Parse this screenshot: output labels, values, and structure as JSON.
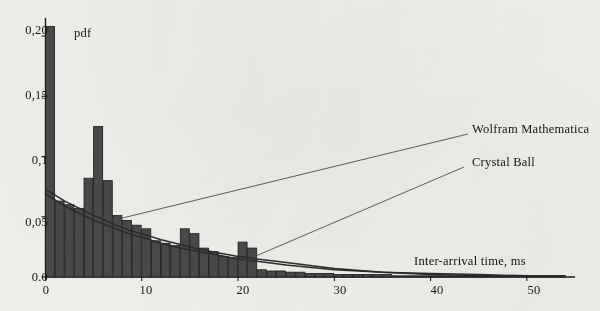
{
  "figure": {
    "background_color": "#f3f1ed",
    "ink_color": "#1c1c1c",
    "bar_fill_color": "#4a4a4a",
    "bar_edge_color": "#1a1a1a",
    "curve_color": "#2b2b2b",
    "leader_line_color": "#4d4d4d"
  },
  "axes": {
    "y_axis_name": "pdf",
    "x_axis_title": "Inter-arrival time, ms",
    "y_tick_labels": [
      "0,20",
      "0,15",
      "0,1",
      "0,05",
      "0.0"
    ],
    "y_tick_values": [
      0.2,
      0.15,
      0.1,
      0.05,
      0.0
    ],
    "x_tick_labels": [
      "0",
      "10",
      "20",
      "30",
      "40",
      "50"
    ],
    "x_tick_values": [
      0,
      10,
      20,
      30,
      40,
      50
    ]
  },
  "annotations": [
    {
      "name": "wolfram-mathematica",
      "label": "Wolfram Mathematica"
    },
    {
      "name": "crystal-ball",
      "label": "Crystal Ball"
    }
  ],
  "chart_data": {
    "type": "bar",
    "title": "",
    "subtitle": "",
    "xlabel": "Inter-arrival time, ms",
    "ylabel": "pdf",
    "xlim": [
      0,
      55
    ],
    "ylim": [
      0.0,
      0.215
    ],
    "grid": false,
    "legend": "annotated leader lines at right",
    "x_tick_labels": [
      "0",
      "10",
      "20",
      "30",
      "40",
      "50"
    ],
    "y_tick_labels": [
      "0,20",
      "0,15",
      "0,1",
      "0,05",
      "0.0"
    ],
    "bin_width": 1,
    "categories": [
      "0-1",
      "1-2",
      "2-3",
      "3-4",
      "4-5",
      "5-6",
      "6-7",
      "7-8",
      "8-9",
      "9-10",
      "10-11",
      "11-12",
      "12-13",
      "13-14",
      "14-15",
      "15-16",
      "16-17",
      "17-18",
      "18-19",
      "19-20",
      "20-21",
      "21-22",
      "22-23",
      "23-24",
      "24-25",
      "25-26",
      "26-27",
      "27-28",
      "28-29",
      "29-30",
      "30-31",
      "31-32",
      "32-33",
      "33-34",
      "34-35",
      "35-36",
      "36-37",
      "37-38",
      "38-39",
      "39-40",
      "40-41",
      "41-42",
      "42-43",
      "43-44",
      "44-45",
      "45-46",
      "46-47",
      "47-48",
      "48-49",
      "49-50",
      "50-51",
      "51-52",
      "52-53",
      "53-54"
    ],
    "values": [
      0.208,
      0.063,
      0.06,
      0.057,
      0.082,
      0.125,
      0.08,
      0.051,
      0.047,
      0.043,
      0.04,
      0.03,
      0.028,
      0.026,
      0.04,
      0.036,
      0.024,
      0.021,
      0.017,
      0.016,
      0.029,
      0.024,
      0.006,
      0.005,
      0.005,
      0.004,
      0.004,
      0.003,
      0.003,
      0.003,
      0.002,
      0.002,
      0.002,
      0.002,
      0.002,
      0.002,
      0.001,
      0.001,
      0.001,
      0.001,
      0.001,
      0.001,
      0.001,
      0.001,
      0.001,
      0.001,
      0.001,
      0.001,
      0.001,
      0.001,
      0.001,
      0.001,
      0.001,
      0.001
    ],
    "series": [
      {
        "name": "Wolfram Mathematica",
        "type": "line",
        "x": [
          0,
          1,
          2,
          3,
          4,
          5,
          6,
          7,
          8,
          9,
          10,
          12,
          14,
          16,
          18,
          20,
          22,
          25,
          30,
          35,
          40,
          45,
          50,
          54
        ],
        "values": [
          0.073,
          0.068,
          0.063,
          0.059,
          0.055,
          0.051,
          0.048,
          0.044,
          0.041,
          0.038,
          0.036,
          0.031,
          0.027,
          0.023,
          0.02,
          0.017,
          0.015,
          0.012,
          0.007,
          0.004,
          0.003,
          0.002,
          0.001,
          0.001
        ]
      },
      {
        "name": "Crystal Ball",
        "type": "line",
        "x": [
          0,
          1,
          2,
          3,
          4,
          5,
          6,
          7,
          8,
          9,
          10,
          12,
          14,
          16,
          18,
          20,
          22,
          25,
          30,
          35,
          40,
          45,
          50,
          54
        ],
        "values": [
          0.069,
          0.064,
          0.059,
          0.055,
          0.051,
          0.047,
          0.044,
          0.041,
          0.038,
          0.035,
          0.033,
          0.028,
          0.024,
          0.021,
          0.018,
          0.015,
          0.013,
          0.01,
          0.006,
          0.004,
          0.002,
          0.001,
          0.001,
          0.001
        ]
      }
    ]
  }
}
